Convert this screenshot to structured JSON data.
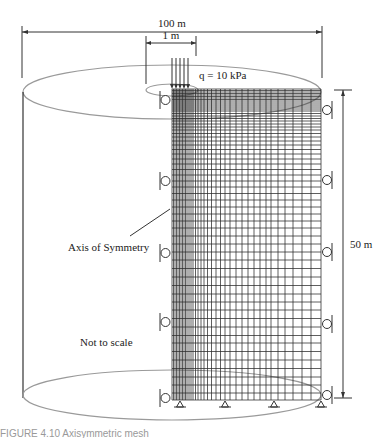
{
  "figure": {
    "labels": {
      "width_dimension": "100 m",
      "load_width_dimension": "1 m",
      "load": "q = 10 kPa",
      "height_dimension": "50 m",
      "axis": "Axis of Symmetry",
      "scale_note": "Not to scale"
    },
    "colors": {
      "lines": "#333333",
      "ellipse": "#9a9a9a",
      "background": "#ffffff"
    },
    "mesh": {
      "left_x": 172,
      "right_x": 321,
      "top_y": 89,
      "bottom_y": 400,
      "vertical_lines_x": [
        172,
        173.5,
        175,
        176.5,
        178,
        179.5,
        181,
        182.5,
        184,
        185.5,
        187,
        189,
        191,
        193,
        195.5,
        198,
        201,
        204,
        207.5,
        211.5,
        216,
        220.5,
        225,
        230,
        236,
        242,
        248,
        254,
        260,
        266,
        271,
        278,
        285,
        293,
        302,
        311,
        321
      ],
      "horizontal_lines_y": [
        89,
        90.5,
        92,
        93.5,
        95,
        96.5,
        98,
        99.5,
        101,
        103,
        105,
        107,
        109,
        111,
        113.5,
        116,
        118.5,
        121,
        124,
        127,
        130,
        133.5,
        137,
        141,
        145,
        149.5,
        154,
        159,
        164,
        169.5,
        175,
        181,
        187,
        193.5,
        200,
        207,
        214,
        221,
        228,
        236,
        244,
        252,
        260,
        268.5,
        277,
        285.5,
        294,
        302,
        310,
        318.5,
        327,
        335.5,
        343,
        351.5,
        360,
        368.5,
        377,
        385,
        393,
        400
      ]
    },
    "load_arrows_x": [
      172,
      176,
      180,
      184,
      188
    ],
    "left_rollers_y": [
      100,
      181,
      253,
      322,
      398
    ],
    "right_rollers_y": [
      110,
      180,
      252,
      324,
      395
    ],
    "pin_supports_x": [
      180,
      225,
      274,
      321
    ]
  },
  "caption": "FIGURE 4.10  Axisymmetric mesh"
}
